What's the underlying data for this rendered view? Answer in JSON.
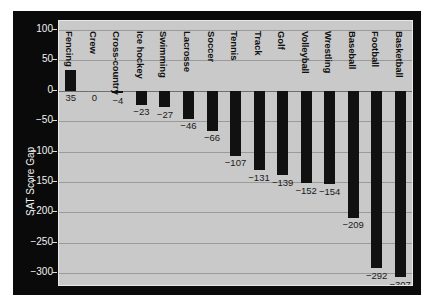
{
  "chart_data": {
    "type": "bar",
    "title": "",
    "xlabel": "",
    "ylabel": "SAT Score Gap",
    "ylim": [
      -320,
      115
    ],
    "yticks": [
      100,
      50,
      0,
      -50,
      -100,
      -150,
      -200,
      -250,
      -300
    ],
    "ytick_labels": [
      "100",
      "50",
      "0",
      "−50",
      "−100",
      "−150",
      "−200",
      "−250",
      "−300"
    ],
    "grid": true,
    "legend": "none",
    "categories": [
      "Fencing",
      "Crew",
      "Cross-country",
      "Ice hockey",
      "Swimming",
      "Lacrosse",
      "Soccer",
      "Tennis",
      "Track",
      "Golf",
      "Volleyball",
      "Wrestling",
      "Baseball",
      "Football",
      "Basketball"
    ],
    "values": [
      35,
      0,
      -4,
      -23,
      -27,
      -46,
      -66,
      -107,
      -131,
      -139,
      -152,
      -154,
      -209,
      -292,
      -307
    ],
    "value_labels": [
      "35",
      "0",
      "−4",
      "−23",
      "−27",
      "−46",
      "−66",
      "−107",
      "−131",
      "−139",
      "−152",
      "−154",
      "−209",
      "−292",
      "−307"
    ],
    "colors": {
      "bar": "#111111",
      "plot_background": "#c9c9c9",
      "figure_background": "#0a0a0a",
      "gridline": "#9a9a9a",
      "axis_text": "#f2f2f2",
      "label_text": "#101010"
    }
  }
}
